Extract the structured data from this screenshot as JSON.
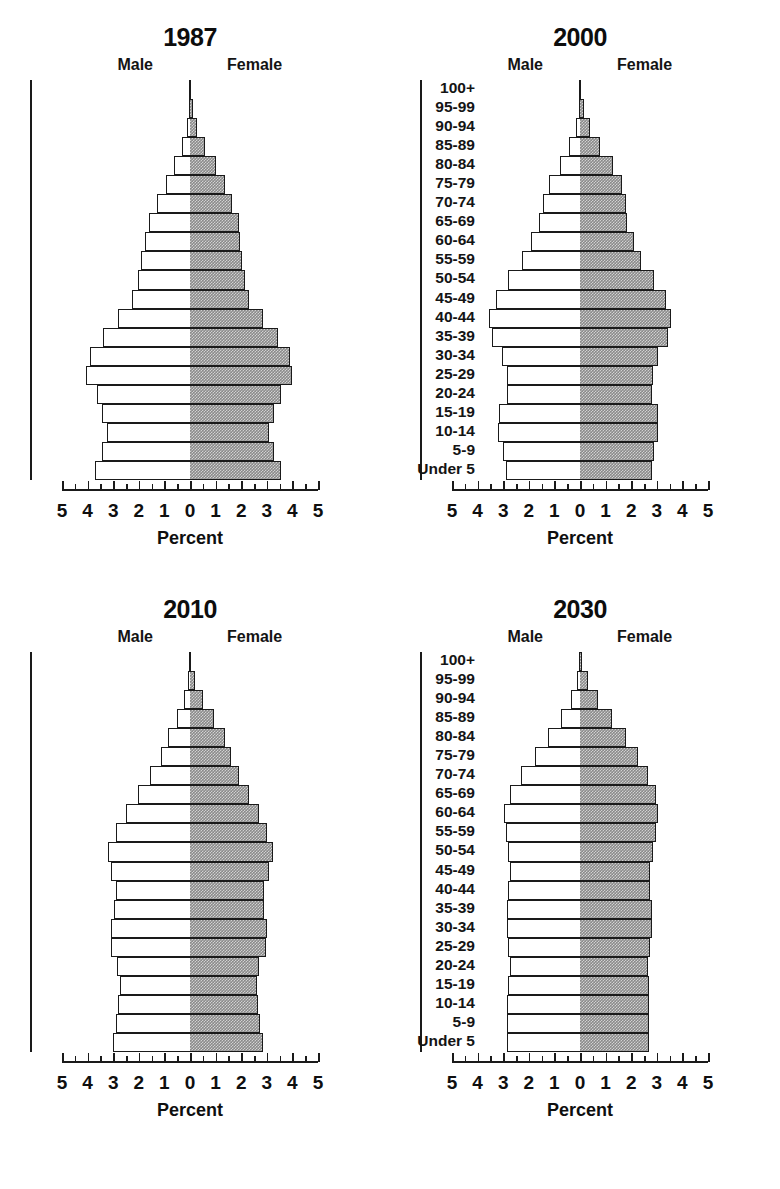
{
  "figure": {
    "axis_label": "Percent",
    "male_legend": "Male",
    "female_legend": "Female",
    "male_color": "#ffffff",
    "female_color": "#8a8a8a",
    "outline_color": "#1a1a1a"
  },
  "age_groups": [
    "100+",
    "95-99",
    "90-94",
    "85-89",
    "80-84",
    "75-79",
    "70-74",
    "65-69",
    "60-64",
    "55-59",
    "50-54",
    "45-49",
    "40-44",
    "35-39",
    "30-34",
    "25-29",
    "20-24",
    "15-19",
    "10-14",
    "5-9",
    "Under 5"
  ],
  "axis_ticks": [
    "5",
    "4",
    "3",
    "2",
    "1",
    "0",
    "1",
    "2",
    "3",
    "4",
    "5"
  ],
  "panels": [
    {
      "key": "p1987",
      "title": "1987"
    },
    {
      "key": "p2000",
      "title": "2000"
    },
    {
      "key": "p2010",
      "title": "2010"
    },
    {
      "key": "p2030",
      "title": "2030"
    }
  ],
  "chart_data": [
    {
      "type": "bar",
      "subtype": "population-pyramid",
      "title": "1987",
      "xlabel": "Percent",
      "ylabel": "",
      "xlim": [
        -5,
        5
      ],
      "xticks": [
        5,
        4,
        3,
        2,
        1,
        0,
        1,
        2,
        3,
        4,
        5
      ],
      "grid": false,
      "legend": [
        "Male",
        "Female"
      ],
      "legend_position": "inside-top",
      "categories": [
        "100+",
        "95-99",
        "90-94",
        "85-89",
        "80-84",
        "75-79",
        "70-74",
        "65-69",
        "60-64",
        "55-59",
        "50-54",
        "45-49",
        "40-44",
        "35-39",
        "30-34",
        "25-29",
        "20-24",
        "15-19",
        "10-14",
        "5-9",
        "Under 5"
      ],
      "series": [
        {
          "name": "Male",
          "values": [
            0.01,
            0.04,
            0.12,
            0.3,
            0.62,
            0.95,
            1.3,
            1.6,
            1.75,
            1.9,
            2.05,
            2.25,
            2.8,
            3.4,
            3.9,
            4.05,
            3.65,
            3.45,
            3.25,
            3.45,
            3.7
          ]
        },
        {
          "name": "Female",
          "values": [
            0.02,
            0.1,
            0.28,
            0.58,
            1.0,
            1.35,
            1.65,
            1.9,
            1.95,
            2.05,
            2.15,
            2.3,
            2.85,
            3.45,
            3.9,
            4.0,
            3.55,
            3.3,
            3.1,
            3.3,
            3.55
          ]
        }
      ]
    },
    {
      "type": "bar",
      "subtype": "population-pyramid",
      "title": "2000",
      "xlabel": "Percent",
      "ylabel": "",
      "xlim": [
        -5,
        5
      ],
      "xticks": [
        5,
        4,
        3,
        2,
        1,
        0,
        1,
        2,
        3,
        4,
        5
      ],
      "grid": false,
      "legend": [
        "Male",
        "Female"
      ],
      "legend_position": "inside-top",
      "categories": [
        "100+",
        "95-99",
        "90-94",
        "85-89",
        "80-84",
        "75-79",
        "70-74",
        "65-69",
        "60-64",
        "55-59",
        "50-54",
        "45-49",
        "40-44",
        "35-39",
        "30-34",
        "25-29",
        "20-24",
        "15-19",
        "10-14",
        "5-9",
        "Under 5"
      ],
      "series": [
        {
          "name": "Male",
          "values": [
            0.01,
            0.05,
            0.17,
            0.42,
            0.8,
            1.2,
            1.45,
            1.6,
            1.9,
            2.25,
            2.8,
            3.3,
            3.55,
            3.45,
            3.05,
            2.85,
            2.85,
            3.15,
            3.2,
            3.0,
            2.9
          ]
        },
        {
          "name": "Female",
          "values": [
            0.03,
            0.14,
            0.4,
            0.8,
            1.3,
            1.65,
            1.8,
            1.85,
            2.1,
            2.4,
            2.9,
            3.35,
            3.55,
            3.45,
            3.05,
            2.85,
            2.8,
            3.05,
            3.05,
            2.9,
            2.8
          ]
        }
      ]
    },
    {
      "type": "bar",
      "subtype": "population-pyramid",
      "title": "2010",
      "xlabel": "Percent",
      "ylabel": "",
      "xlim": [
        -5,
        5
      ],
      "xticks": [
        5,
        4,
        3,
        2,
        1,
        0,
        1,
        2,
        3,
        4,
        5
      ],
      "grid": false,
      "legend": [
        "Male",
        "Female"
      ],
      "legend_position": "inside-top",
      "categories": [
        "100+",
        "95-99",
        "90-94",
        "85-89",
        "80-84",
        "75-79",
        "70-74",
        "65-69",
        "60-64",
        "55-59",
        "50-54",
        "45-49",
        "40-44",
        "35-39",
        "30-34",
        "25-29",
        "20-24",
        "15-19",
        "10-14",
        "5-9",
        "Under 5"
      ],
      "series": [
        {
          "name": "Male",
          "values": [
            0.02,
            0.07,
            0.22,
            0.5,
            0.85,
            1.15,
            1.55,
            2.05,
            2.5,
            2.9,
            3.2,
            3.1,
            2.9,
            2.95,
            3.1,
            3.1,
            2.85,
            2.75,
            2.8,
            2.9,
            3.0
          ]
        },
        {
          "name": "Female",
          "values": [
            0.05,
            0.2,
            0.52,
            0.95,
            1.35,
            1.6,
            1.9,
            2.3,
            2.7,
            3.0,
            3.25,
            3.1,
            2.9,
            2.9,
            3.0,
            2.95,
            2.7,
            2.6,
            2.65,
            2.75,
            2.85
          ]
        }
      ]
    },
    {
      "type": "bar",
      "subtype": "population-pyramid",
      "title": "2030",
      "xlabel": "Percent",
      "ylabel": "",
      "xlim": [
        -5,
        5
      ],
      "xticks": [
        5,
        4,
        3,
        2,
        1,
        0,
        1,
        2,
        3,
        4,
        5
      ],
      "grid": false,
      "legend": [
        "Male",
        "Female"
      ],
      "legend_position": "inside-top",
      "categories": [
        "100+",
        "95-99",
        "90-94",
        "85-89",
        "80-84",
        "75-79",
        "70-74",
        "65-69",
        "60-64",
        "55-59",
        "50-54",
        "45-49",
        "40-44",
        "35-39",
        "30-34",
        "25-29",
        "20-24",
        "15-19",
        "10-14",
        "5-9",
        "Under 5"
      ],
      "series": [
        {
          "name": "Male",
          "values": [
            0.03,
            0.12,
            0.35,
            0.75,
            1.25,
            1.75,
            2.3,
            2.75,
            2.95,
            2.9,
            2.8,
            2.75,
            2.8,
            2.85,
            2.85,
            2.8,
            2.75,
            2.8,
            2.85,
            2.85,
            2.85
          ]
        },
        {
          "name": "Female",
          "values": [
            0.08,
            0.3,
            0.72,
            1.25,
            1.8,
            2.25,
            2.65,
            2.95,
            3.05,
            2.95,
            2.85,
            2.75,
            2.75,
            2.8,
            2.8,
            2.75,
            2.65,
            2.7,
            2.7,
            2.7,
            2.7
          ]
        }
      ]
    }
  ]
}
